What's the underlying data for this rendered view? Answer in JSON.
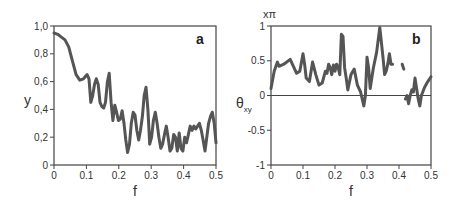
{
  "chart_data": [
    {
      "type": "line",
      "panel_label": "a",
      "xlabel": "f",
      "ylabel": "y",
      "xlim": [
        0,
        0.5
      ],
      "ylim": [
        0,
        1.0
      ],
      "xticks": [
        "0",
        "0.1",
        "0.2",
        "0.3",
        "0.4",
        "0.5"
      ],
      "yticks": [
        "0",
        "0,2",
        "0,4",
        "0,6",
        "0,8",
        "1,0"
      ],
      "grid": false,
      "line_color": "#555555",
      "series": [
        {
          "name": "y",
          "x": [
            0,
            0.01,
            0.02,
            0.03,
            0.04,
            0.05,
            0.06,
            0.07,
            0.08,
            0.09,
            0.095,
            0.1,
            0.105,
            0.11,
            0.115,
            0.12,
            0.125,
            0.13,
            0.135,
            0.14,
            0.145,
            0.15,
            0.155,
            0.16,
            0.165,
            0.17,
            0.175,
            0.18,
            0.185,
            0.19,
            0.195,
            0.2,
            0.205,
            0.21,
            0.215,
            0.22,
            0.225,
            0.23,
            0.235,
            0.24,
            0.245,
            0.25,
            0.255,
            0.26,
            0.265,
            0.27,
            0.275,
            0.28,
            0.285,
            0.29,
            0.295,
            0.3,
            0.305,
            0.31,
            0.315,
            0.32,
            0.325,
            0.33,
            0.335,
            0.34,
            0.345,
            0.35,
            0.355,
            0.36,
            0.365,
            0.37,
            0.375,
            0.38,
            0.385,
            0.39,
            0.395,
            0.4,
            0.405,
            0.41,
            0.415,
            0.42,
            0.425,
            0.43,
            0.435,
            0.44,
            0.445,
            0.45,
            0.455,
            0.46,
            0.465,
            0.47,
            0.475,
            0.48,
            0.485,
            0.49,
            0.495,
            0.5
          ],
          "y": [
            0.95,
            0.94,
            0.92,
            0.9,
            0.85,
            0.75,
            0.65,
            0.61,
            0.62,
            0.65,
            0.62,
            0.45,
            0.5,
            0.58,
            0.62,
            0.58,
            0.45,
            0.42,
            0.41,
            0.45,
            0.6,
            0.66,
            0.45,
            0.32,
            0.43,
            0.38,
            0.32,
            0.33,
            0.39,
            0.3,
            0.18,
            0.09,
            0.15,
            0.3,
            0.38,
            0.36,
            0.25,
            0.18,
            0.25,
            0.35,
            0.5,
            0.56,
            0.4,
            0.15,
            0.2,
            0.32,
            0.38,
            0.3,
            0.2,
            0.12,
            0.15,
            0.22,
            0.28,
            0.2,
            0.1,
            0.12,
            0.22,
            0.2,
            0.1,
            0.23,
            0.12,
            0.1,
            0.2,
            0.16,
            0.22,
            0.28,
            0.25,
            0.28,
            0.26,
            0.28,
            0.3,
            0.25,
            0.18,
            0.1,
            0.2,
            0.3,
            0.35,
            0.38,
            0.3,
            0.16,
            0.0,
            0.0,
            0.0,
            0.0,
            0.0,
            0.0,
            0.0,
            0.0,
            0.0,
            0.0,
            0.0,
            0.0
          ]
        }
      ]
    },
    {
      "type": "line",
      "panel_label": "b",
      "xlabel": "f",
      "ylabel": "θxy",
      "ylabel_main": "θ",
      "ylabel_sub": "xy",
      "unit_label": "xπ",
      "xlim": [
        0,
        0.5
      ],
      "ylim": [
        -1,
        1
      ],
      "xticks": [
        "0",
        "0.1",
        "0.2",
        "0.3",
        "0.4",
        "0.5"
      ],
      "yticks": [
        "-1",
        "-0.5",
        "0",
        "0.5",
        "1"
      ],
      "zero_line": true,
      "grid": false,
      "line_color": "#555555",
      "series": [
        {
          "name": "θxy segment 1",
          "x": [
            0,
            0.01,
            0.02,
            0.025,
            0.04,
            0.06,
            0.07,
            0.08,
            0.09,
            0.1,
            0.105,
            0.11,
            0.12,
            0.13,
            0.14,
            0.15,
            0.16,
            0.17,
            0.175,
            0.18,
            0.185,
            0.19,
            0.195,
            0.2,
            0.205,
            0.21,
            0.215,
            0.22,
            0.225,
            0.23,
            0.235,
            0.24,
            0.25,
            0.26,
            0.27,
            0.28,
            0.29,
            0.295,
            0.3,
            0.305,
            0.31,
            0.32,
            0.33,
            0.34,
            0.35,
            0.355,
            0.36,
            0.365,
            0.37,
            0.375,
            0.38
          ],
          "y": [
            0.1,
            0.35,
            0.48,
            0.42,
            0.45,
            0.52,
            0.42,
            0.32,
            0.35,
            0.6,
            0.45,
            0.25,
            0.2,
            0.48,
            0.3,
            0.15,
            0.18,
            0.35,
            0.32,
            0.45,
            0.4,
            0.3,
            0.44,
            0.35,
            0.45,
            0.4,
            0.3,
            0.88,
            0.85,
            0.4,
            0.25,
            0.08,
            0.3,
            0.38,
            0.15,
            0.05,
            -0.15,
            0.0,
            0.55,
            0.4,
            0.1,
            0.4,
            0.62,
            0.98,
            0.55,
            0.3,
            0.35,
            0.45,
            0.6,
            0.45,
            0.45
          ]
        },
        {
          "name": "θxy segment 2",
          "x": [
            0.41,
            0.415
          ],
          "y": [
            0.45,
            0.38
          ]
        },
        {
          "name": "θxy segment 3",
          "x": [
            0.42,
            0.425,
            0.43,
            0.435,
            0.44,
            0.445,
            0.45,
            0.455,
            0.46,
            0.465,
            0.47,
            0.48,
            0.49,
            0.5
          ],
          "y": [
            -0.05,
            0.0,
            -0.12,
            0.0,
            0.08,
            0.05,
            0.25,
            0.1,
            -0.05,
            -0.15,
            0.0,
            0.12,
            0.2,
            0.27
          ]
        }
      ]
    }
  ]
}
